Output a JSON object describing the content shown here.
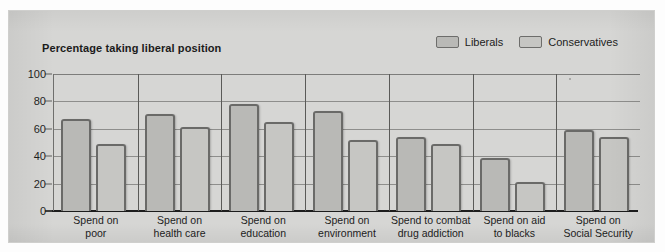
{
  "figure": {
    "title": "Percentage taking liberal position",
    "panel_color": "#d6d6d4",
    "axis_color": "#1d1d1d"
  },
  "legend": {
    "position": "top-right",
    "items": [
      {
        "label": "Liberals",
        "swatch_color": "#b9b9b6",
        "icon": "legend-swatch-icon"
      },
      {
        "label": "Conservatives",
        "swatch_color": "#c6c6c3",
        "icon": "legend-swatch-icon"
      }
    ]
  },
  "chart_data": {
    "type": "bar",
    "title": "Percentage taking liberal position",
    "xlabel": "",
    "ylabel": "",
    "ylim": [
      0,
      100
    ],
    "yticks": [
      0,
      20,
      40,
      60,
      80,
      100
    ],
    "ytick_labels": [
      "0",
      "20",
      "40",
      "60",
      "80",
      "100"
    ],
    "grid": true,
    "legend_position": "top-right",
    "categories": [
      "Spend on poor",
      "Spend on health care",
      "Spend on education",
      "Spend on environment",
      "Spend to combat drug addiction",
      "Spend on aid to blacks",
      "Spend on Social Security"
    ],
    "category_lines": [
      [
        "Spend on",
        "poor"
      ],
      [
        "Spend on",
        "health care"
      ],
      [
        "Spend on",
        "education"
      ],
      [
        "Spend on",
        "environment"
      ],
      [
        "Spend to combat",
        "drug addiction"
      ],
      [
        "Spend on aid",
        "to blacks"
      ],
      [
        "Spend on",
        "Social Security"
      ]
    ],
    "series": [
      {
        "name": "Liberals",
        "color": "#b9b9b6",
        "values": [
          67,
          71,
          78,
          73,
          54,
          39,
          59
        ]
      },
      {
        "name": "Conservatives",
        "color": "#c6c6c3",
        "values": [
          49,
          61,
          65,
          52,
          49,
          21,
          54
        ]
      }
    ]
  }
}
